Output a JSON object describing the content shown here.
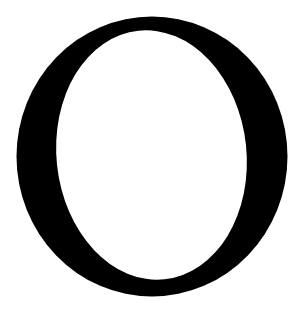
{
  "glyph": {
    "character": "O",
    "style": "serif",
    "fill_color": "#000000",
    "background_color": "#ffffff"
  }
}
